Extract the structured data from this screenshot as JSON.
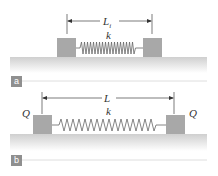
{
  "panels": [
    {
      "id": "a",
      "tag": "a",
      "length_label": "L",
      "length_subscript": "i",
      "spring_label": "k",
      "charges": []
    },
    {
      "id": "b",
      "tag": "b",
      "length_label": "L",
      "length_subscript": "",
      "spring_label": "k",
      "charges": [
        "Q",
        "Q"
      ]
    }
  ],
  "colors": {
    "block": "#a8a8a8",
    "surface_top": "#cfcfcf",
    "surface_bottom": "#ffffff",
    "tag_bg": "#8f8f8f",
    "line": "#333333"
  }
}
